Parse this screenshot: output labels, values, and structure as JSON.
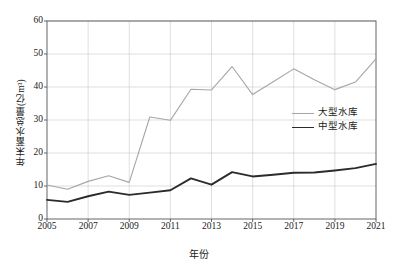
{
  "chart_data": {
    "type": "line",
    "title": "",
    "xlabel": "年份",
    "ylabel": "年末蓄水总量(亿m³)",
    "xlim": [
      2005,
      2021
    ],
    "ylim": [
      0,
      60
    ],
    "ytick_labels": [
      "0",
      "10",
      "20",
      "30",
      "40",
      "50",
      "60"
    ],
    "yticks": [
      0,
      10,
      20,
      30,
      40,
      50,
      60
    ],
    "xtick_labels": [
      "2005",
      "2007",
      "2009",
      "2011",
      "2013",
      "2015",
      "2017",
      "2019",
      "2021"
    ],
    "xticks": [
      2005,
      2007,
      2009,
      2011,
      2013,
      2015,
      2017,
      2019,
      2021
    ],
    "grid": true,
    "legend_position": "center-right",
    "x": [
      2005,
      2006,
      2007,
      2008,
      2009,
      2010,
      2011,
      2012,
      2013,
      2014,
      2015,
      2016,
      2017,
      2018,
      2019,
      2020,
      2021
    ],
    "series": [
      {
        "name": "大型水库",
        "color": "#a6a6a6",
        "width": 1.1,
        "values": [
          10.3,
          9.0,
          11.4,
          13.1,
          11.1,
          30.9,
          29.9,
          39.3,
          39.1,
          46.2,
          37.7,
          41.6,
          45.5,
          42.2,
          39.2,
          41.5,
          48.5
        ]
      },
      {
        "name": "中型水库",
        "color": "#2b2b2b",
        "width": 1.9,
        "values": [
          5.8,
          5.2,
          6.9,
          8.3,
          7.3,
          8.0,
          8.7,
          12.3,
          10.4,
          14.2,
          12.9,
          13.4,
          14.0,
          14.1,
          14.7,
          15.4,
          16.7
        ]
      }
    ]
  },
  "legend": {
    "items": [
      {
        "label": "大型水库"
      },
      {
        "label": "中型水库"
      }
    ]
  }
}
